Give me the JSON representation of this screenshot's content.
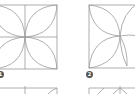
{
  "colors": {
    "stroke": "#9a9a9a",
    "badge_bg": "#555555",
    "badge_fg": "#ffffff",
    "background": "#ffffff"
  },
  "steps": [
    {
      "number": "1",
      "description": "four-petal orange-peel pattern in square with center cross"
    },
    {
      "number": "2",
      "description": "orange-peel pattern with petals partially drawn"
    }
  ]
}
